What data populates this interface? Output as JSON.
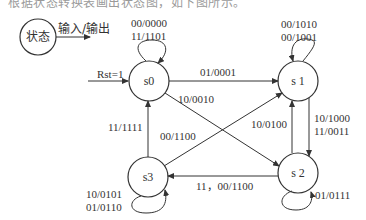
{
  "caption": "根据状态转换表画出状态图，如下图所示。",
  "legend": {
    "state_label": "状态",
    "arrow_label": "输入/输出"
  },
  "reset": {
    "label": "Rst=1"
  },
  "states": [
    {
      "id": "s0",
      "label": "s0",
      "cx": 141,
      "cy": 81
    },
    {
      "id": "s1",
      "label": "s 1",
      "cx": 298,
      "cy": 81
    },
    {
      "id": "s2",
      "label": "s 2",
      "cx": 298,
      "cy": 172
    },
    {
      "id": "s3",
      "label": "s3",
      "cx": 141,
      "cy": 177
    }
  ],
  "transitions": {
    "s0_self": [
      "00/0000",
      "11/1101"
    ],
    "s0_s1": "01/0001",
    "s0_s2": "10/0010",
    "s1_self": [
      "00/1010",
      "00/1001"
    ],
    "s1_s2": [
      "10/1000",
      "11/0011"
    ],
    "s2_s1": "10/0100",
    "s2_s3": "11，00/1100",
    "s2_self": "01/0111",
    "s3_s0": "11/1111",
    "s3_s1": "00/1100",
    "s3_self": [
      "10/0101",
      "01/0110"
    ]
  },
  "colors": {
    "stroke": "#333333",
    "text": "#333333",
    "background": "#ffffff"
  }
}
